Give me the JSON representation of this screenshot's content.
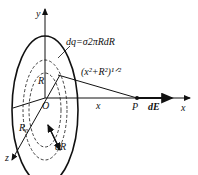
{
  "diagram": {
    "labels": {
      "y_axis": "y",
      "x_axis": "x",
      "z_axis": "z",
      "origin": "O",
      "ring_charge": "dq=σ2πRdR",
      "distance": "(x²+R²)¹ᐟ²",
      "radius": "R",
      "disk_radius": "R₀",
      "ring_width": "dR",
      "x_distance": "x",
      "point": "P",
      "field": "dE"
    },
    "colors": {
      "stroke": "#111111",
      "background": "#ffffff"
    }
  }
}
